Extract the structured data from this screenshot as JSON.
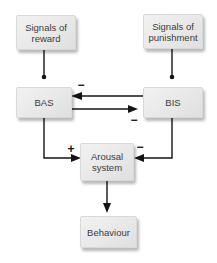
{
  "palette": {
    "background": "#ffffff",
    "box_fill_top": "#f2f2f2",
    "box_fill_bottom": "#dfdfdf",
    "box_border": "#d9d9d9",
    "line_color": "#141414",
    "text_color": "#3c3c3c"
  },
  "nodes": {
    "signals_reward": {
      "label": "Signals of reward"
    },
    "signals_punishment": {
      "label": "Signals of punishment"
    },
    "bas": {
      "label": "BAS"
    },
    "bis": {
      "label": "BIS"
    },
    "arousal_system": {
      "label": "Arousal system"
    },
    "behaviour": {
      "label": "Behaviour"
    }
  },
  "signs": {
    "bis_inhibits_bas": "−",
    "bas_inhibits_bis": "−",
    "bas_excites_arousal": "+",
    "bis_inhibits_arousal": "−"
  },
  "edges": [
    {
      "from": "signals_reward",
      "to": "bas",
      "terminal": "dot",
      "sign": ""
    },
    {
      "from": "signals_punishment",
      "to": "bis",
      "terminal": "dot",
      "sign": ""
    },
    {
      "from": "bis",
      "to": "bas",
      "terminal": "arrow",
      "sign": "−"
    },
    {
      "from": "bas",
      "to": "bis",
      "terminal": "arrow",
      "sign": "−"
    },
    {
      "from": "bas",
      "to": "arousal_system",
      "terminal": "arrow",
      "sign": "+"
    },
    {
      "from": "bis",
      "to": "arousal_system",
      "terminal": "arrow",
      "sign": "−"
    },
    {
      "from": "arousal_system",
      "to": "behaviour",
      "terminal": "arrow",
      "sign": ""
    }
  ]
}
